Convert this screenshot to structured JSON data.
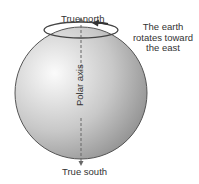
{
  "diagram": {
    "labels": {
      "north": "True north",
      "south": "True south",
      "axis": "Polar axis",
      "rotation_line1": "The earth",
      "rotation_line2": "rotates toward",
      "rotation_line3": "the east"
    },
    "colors": {
      "sphere_light": "#f4f4f4",
      "sphere_dark": "#8a8a8a",
      "outline": "#555555",
      "text": "#333333"
    }
  }
}
